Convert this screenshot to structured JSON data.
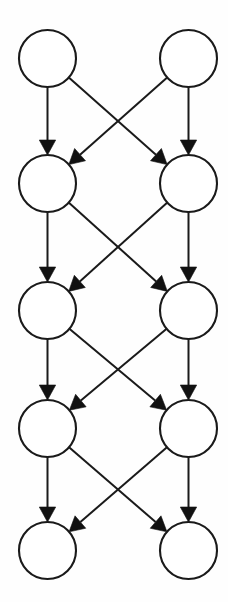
{
  "diagram": {
    "type": "directed-graph",
    "background_color": "#fefefe",
    "stroke_color": "#1a1a1a",
    "node_fill_color": "#ffffff",
    "arrow_fill_color": "#111111",
    "layer_count": 5,
    "nodes_per_layer": 2,
    "node_count": 10,
    "edge_count": 16,
    "node_radius": 28.5,
    "canvas": {
      "width": 228,
      "height": 602
    },
    "columns": {
      "left_center_x": 47.5,
      "right_center_x": 188.5
    },
    "layer_center_y": [
      58.5,
      183.5,
      310.5,
      428.5,
      550.5
    ],
    "nodes": [
      {
        "id": "n0",
        "layer": 0,
        "column": "left",
        "cx": 47.5,
        "cy": 58.5,
        "r": 28.5,
        "label": ""
      },
      {
        "id": "n1",
        "layer": 0,
        "column": "right",
        "cx": 188.5,
        "cy": 58.5,
        "r": 28.5,
        "label": ""
      },
      {
        "id": "n2",
        "layer": 1,
        "column": "left",
        "cx": 47.5,
        "cy": 183.5,
        "r": 28.5,
        "label": ""
      },
      {
        "id": "n3",
        "layer": 1,
        "column": "right",
        "cx": 188.5,
        "cy": 183.5,
        "r": 28.5,
        "label": ""
      },
      {
        "id": "n4",
        "layer": 2,
        "column": "left",
        "cx": 47.5,
        "cy": 310.5,
        "r": 28.5,
        "label": ""
      },
      {
        "id": "n5",
        "layer": 2,
        "column": "right",
        "cx": 188.5,
        "cy": 310.5,
        "r": 28.5,
        "label": ""
      },
      {
        "id": "n6",
        "layer": 3,
        "column": "left",
        "cx": 47.5,
        "cy": 428.5,
        "r": 28.5,
        "label": ""
      },
      {
        "id": "n7",
        "layer": 3,
        "column": "right",
        "cx": 188.5,
        "cy": 428.5,
        "r": 28.5,
        "label": ""
      },
      {
        "id": "n8",
        "layer": 4,
        "column": "left",
        "cx": 47.5,
        "cy": 550.5,
        "r": 28.5,
        "label": ""
      },
      {
        "id": "n9",
        "layer": 4,
        "column": "right",
        "cx": 188.5,
        "cy": 550.5,
        "r": 28.5,
        "label": ""
      }
    ],
    "edges": [
      {
        "id": "e0",
        "from": "n0",
        "to": "n2",
        "kind": "vertical",
        "label": ""
      },
      {
        "id": "e1",
        "from": "n0",
        "to": "n3",
        "kind": "diagonal",
        "label": ""
      },
      {
        "id": "e2",
        "from": "n1",
        "to": "n2",
        "kind": "diagonal",
        "label": ""
      },
      {
        "id": "e3",
        "from": "n1",
        "to": "n3",
        "kind": "vertical",
        "label": ""
      },
      {
        "id": "e4",
        "from": "n2",
        "to": "n4",
        "kind": "vertical",
        "label": ""
      },
      {
        "id": "e5",
        "from": "n2",
        "to": "n5",
        "kind": "diagonal",
        "label": ""
      },
      {
        "id": "e6",
        "from": "n3",
        "to": "n4",
        "kind": "diagonal",
        "label": ""
      },
      {
        "id": "e7",
        "from": "n3",
        "to": "n5",
        "kind": "vertical",
        "label": ""
      },
      {
        "id": "e8",
        "from": "n4",
        "to": "n6",
        "kind": "vertical",
        "label": ""
      },
      {
        "id": "e9",
        "from": "n4",
        "to": "n7",
        "kind": "diagonal",
        "label": ""
      },
      {
        "id": "e10",
        "from": "n5",
        "to": "n6",
        "kind": "diagonal",
        "label": ""
      },
      {
        "id": "e11",
        "from": "n5",
        "to": "n7",
        "kind": "vertical",
        "label": ""
      },
      {
        "id": "e12",
        "from": "n6",
        "to": "n8",
        "kind": "vertical",
        "label": ""
      },
      {
        "id": "e13",
        "from": "n6",
        "to": "n9",
        "kind": "diagonal",
        "label": ""
      },
      {
        "id": "e14",
        "from": "n7",
        "to": "n8",
        "kind": "diagonal",
        "label": ""
      },
      {
        "id": "e15",
        "from": "n7",
        "to": "n9",
        "kind": "vertical",
        "label": ""
      }
    ]
  }
}
